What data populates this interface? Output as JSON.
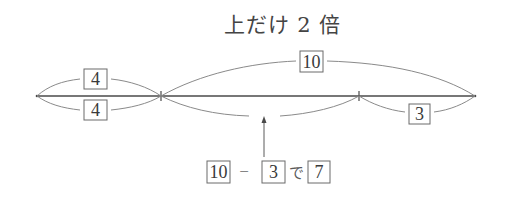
{
  "title": "上だけ 2 倍",
  "number_line": {
    "points_x": [
      37,
      161,
      359,
      475
    ],
    "y": 96
  },
  "labels": {
    "top_left": "4",
    "bottom_left": "4",
    "top_long": "10",
    "bottom_right": "3"
  },
  "equation": {
    "operand1": "10",
    "operator": "−",
    "operand2": "3",
    "particle": "で",
    "result": "7"
  },
  "colors": {
    "line": "#4a4a4a",
    "arc": "#8a8a8a",
    "box_border": "#6a6a6a",
    "text": "#3a3a3a"
  }
}
